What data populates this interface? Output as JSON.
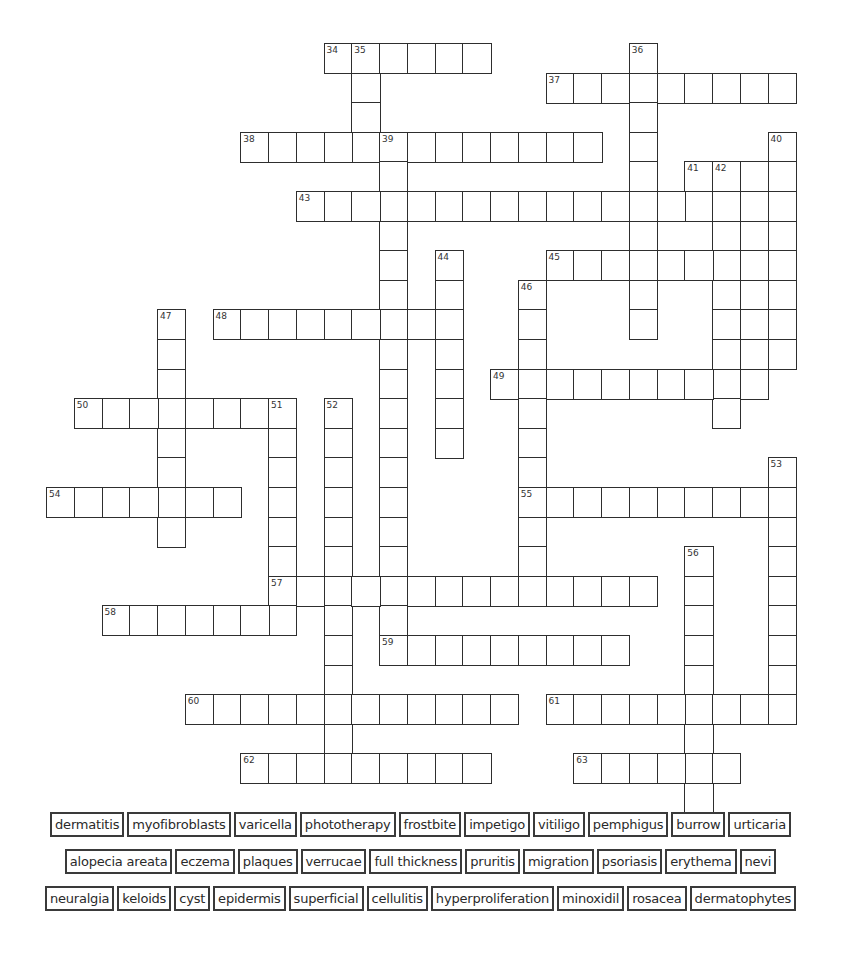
{
  "puzzle": {
    "grid_origin": {
      "x": 46,
      "y": 43
    },
    "cell_size": {
      "w": 27.75,
      "h": 29.6
    },
    "entries": [
      {
        "number": "34",
        "direction": "across",
        "row": 0,
        "col": 10,
        "length": 6
      },
      {
        "number": "35",
        "direction": "down",
        "row": 0,
        "col": 11,
        "length": 4
      },
      {
        "number": "36",
        "direction": "down",
        "row": 0,
        "col": 21,
        "length": 10
      },
      {
        "number": "37",
        "direction": "across",
        "row": 1,
        "col": 18,
        "length": 9
      },
      {
        "number": "38",
        "direction": "across",
        "row": 3,
        "col": 7,
        "length": 13
      },
      {
        "number": "39",
        "direction": "down",
        "row": 3,
        "col": 12,
        "length": 18
      },
      {
        "number": "40",
        "direction": "down",
        "row": 3,
        "col": 26,
        "length": 8
      },
      {
        "number": "41",
        "direction": "across",
        "row": 4,
        "col": 23,
        "length": 4
      },
      {
        "number": "41",
        "direction": "down",
        "row": 4,
        "col": 23,
        "length": 2
      },
      {
        "number": "42",
        "direction": "down",
        "row": 4,
        "col": 24,
        "length": 9
      },
      {
        "number": "",
        "direction": "down",
        "row": 4,
        "col": 25,
        "length": 8
      },
      {
        "number": "43",
        "direction": "across",
        "row": 5,
        "col": 9,
        "length": 15
      },
      {
        "number": "44",
        "direction": "down",
        "row": 7,
        "col": 14,
        "length": 7
      },
      {
        "number": "45",
        "direction": "across",
        "row": 7,
        "col": 18,
        "length": 9
      },
      {
        "number": "46",
        "direction": "down",
        "row": 8,
        "col": 17,
        "length": 11
      },
      {
        "number": "47",
        "direction": "down",
        "row": 9,
        "col": 4,
        "length": 8
      },
      {
        "number": "48",
        "direction": "across",
        "row": 9,
        "col": 6,
        "length": 9
      },
      {
        "number": "49",
        "direction": "across",
        "row": 11,
        "col": 16,
        "length": 10
      },
      {
        "number": "50",
        "direction": "across",
        "row": 12,
        "col": 1,
        "length": 8
      },
      {
        "number": "51",
        "direction": "down",
        "row": 12,
        "col": 8,
        "length": 8
      },
      {
        "number": "52",
        "direction": "down",
        "row": 12,
        "col": 10,
        "length": 13
      },
      {
        "number": "53",
        "direction": "down",
        "row": 14,
        "col": 26,
        "length": 9
      },
      {
        "number": "54",
        "direction": "across",
        "row": 15,
        "col": 0,
        "length": 7
      },
      {
        "number": "55",
        "direction": "across",
        "row": 15,
        "col": 17,
        "length": 10
      },
      {
        "number": "56",
        "direction": "down",
        "row": 17,
        "col": 23,
        "length": 9
      },
      {
        "number": "57",
        "direction": "across",
        "row": 18,
        "col": 8,
        "length": 14
      },
      {
        "number": "58",
        "direction": "across",
        "row": 19,
        "col": 2,
        "length": 7
      },
      {
        "number": "59",
        "direction": "across",
        "row": 20,
        "col": 12,
        "length": 9
      },
      {
        "number": "60",
        "direction": "across",
        "row": 22,
        "col": 5,
        "length": 12
      },
      {
        "number": "61",
        "direction": "across",
        "row": 22,
        "col": 18,
        "length": 9
      },
      {
        "number": "62",
        "direction": "across",
        "row": 24,
        "col": 7,
        "length": 9
      },
      {
        "number": "63",
        "direction": "across",
        "row": 24,
        "col": 19,
        "length": 6
      }
    ]
  },
  "word_bank": {
    "rows": [
      [
        "dermatitis",
        "myofibroblasts",
        "varicella",
        "phototherapy",
        "frostbite",
        "impetigo",
        "vitiligo",
        "pemphigus",
        "burrow",
        "urticaria"
      ],
      [
        "alopecia areata",
        "eczema",
        "plaques",
        "verrucae",
        "full thickness",
        "pruritis",
        "migration",
        "psoriasis",
        "erythema",
        "nevi"
      ],
      [
        "neuralgia",
        "keloids",
        "cyst",
        "epidermis",
        "superficial",
        "cellulitis",
        "hyperproliferation",
        "minoxidil",
        "rosacea",
        "dermatophytes"
      ]
    ]
  }
}
